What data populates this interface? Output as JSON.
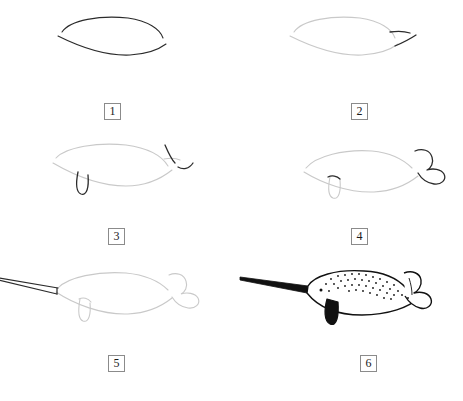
{
  "page": {
    "kind": "drawing-tutorial",
    "background_color": "#ffffff",
    "width": 463,
    "height": 401,
    "grid": {
      "columns": 2,
      "rows": 3
    }
  },
  "ink": {
    "new_stroke_color": "#2b2b2b",
    "old_stroke_color": "#c9c9c9",
    "fill_color": "#111111",
    "badge_border_color": "#8b8b8b",
    "badge_text_color": "#1a1a1a"
  },
  "steps": [
    {
      "number": "1",
      "label": "Step 1",
      "description": "Two curved strokes forming the open body outline",
      "badge_x": 104,
      "badge_y": 103,
      "panel_x": 0,
      "panel_y": 0
    },
    {
      "number": "2",
      "label": "Step 2",
      "description": "Add two short tapered strokes at the tail end",
      "badge_x": 351,
      "badge_y": 103,
      "panel_x": 232,
      "panel_y": 0
    },
    {
      "number": "3",
      "label": "Step 3",
      "description": "Add the flipper loop under the belly and begin the tail fin",
      "badge_x": 108,
      "badge_y": 228,
      "panel_x": 0,
      "panel_y": 130
    },
    {
      "number": "4",
      "label": "Step 4",
      "description": "Close the tail into a two-lobed fluke",
      "badge_x": 351,
      "badge_y": 228,
      "panel_x": 232,
      "panel_y": 130
    },
    {
      "number": "5",
      "label": "Step 5",
      "description": "Draw the long tapering tusk out to the left",
      "badge_x": 108,
      "badge_y": 355,
      "panel_x": 0,
      "panel_y": 255
    },
    {
      "number": "6",
      "label": "Step 6",
      "description": "Ink the outline, fill the tusk and flipper black, add speckles and eye",
      "badge_x": 360,
      "badge_y": 355,
      "panel_x": 232,
      "panel_y": 255
    }
  ]
}
